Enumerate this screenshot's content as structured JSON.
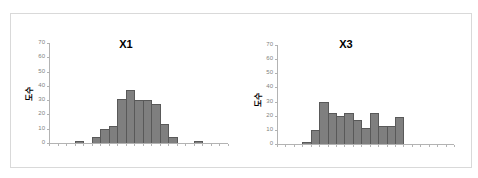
{
  "chart_data": [
    {
      "type": "bar",
      "title": "X1",
      "xlabel": "",
      "ylabel": "도수",
      "ylim": [
        0,
        70
      ],
      "yticks": [
        0,
        10,
        20,
        30,
        40,
        50,
        60,
        70
      ],
      "grid": false,
      "legend": null,
      "bins": 21,
      "values": [
        0,
        0,
        0,
        1,
        0,
        4,
        10,
        12,
        31,
        37,
        30,
        30,
        27,
        13,
        4,
        0,
        0,
        1,
        0,
        0,
        0
      ]
    },
    {
      "type": "bar",
      "title": "X3",
      "xlabel": "",
      "ylabel": "도수",
      "ylim": [
        0,
        70
      ],
      "yticks": [
        0,
        10,
        20,
        30,
        40,
        50,
        60,
        70
      ],
      "grid": false,
      "legend": null,
      "bins": 21,
      "values": [
        0,
        0,
        0,
        1,
        10,
        30,
        22,
        20,
        22,
        17,
        11,
        22,
        13,
        13,
        19,
        0,
        0,
        0,
        0,
        0,
        0
      ]
    }
  ],
  "charts": [
    {
      "title": "X1",
      "ylabel": "도수"
    },
    {
      "title": "X3",
      "ylabel": "도수"
    }
  ]
}
